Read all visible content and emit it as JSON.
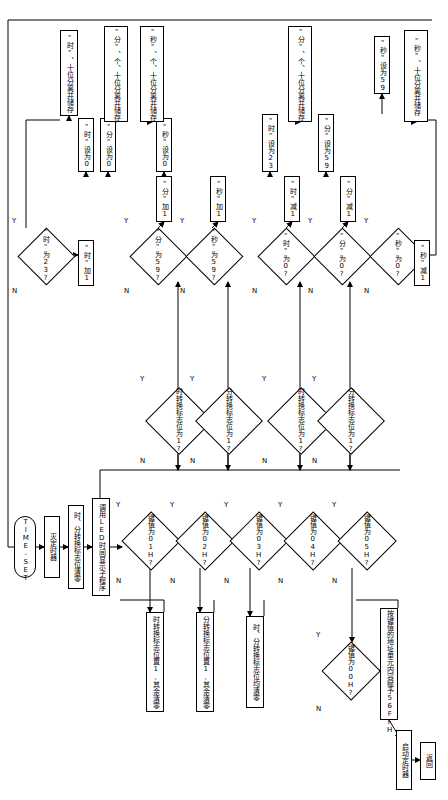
{
  "meta": {
    "branch_yes": "Y",
    "branch_no": "N"
  },
  "nodes": [
    {
      "id": "n_start",
      "type": "terminator",
      "text": "TIME-SET",
      "x": 14,
      "y": 516,
      "w": 22,
      "h": 62
    },
    {
      "id": "n_kill",
      "type": "process",
      "text": "灭定时器",
      "x": 44,
      "y": 516,
      "w": 16,
      "h": 62
    },
    {
      "id": "n_hflag",
      "type": "process",
      "text": "时、分转换标志位清零",
      "x": 68,
      "y": 505,
      "w": 16,
      "h": 84
    },
    {
      "id": "n_led",
      "type": "process",
      "text": "调用LED时间显示子程序",
      "x": 92,
      "y": 498,
      "w": 18,
      "h": 98
    },
    {
      "id": "n_k1",
      "type": "decision",
      "text": "键值为01H?",
      "x": 122,
      "y": 512,
      "w": 56,
      "h": 56
    },
    {
      "id": "n_k2",
      "type": "decision",
      "text": "键值为02H?",
      "x": 176,
      "y": 512,
      "w": 56,
      "h": 56
    },
    {
      "id": "n_k3",
      "type": "decision",
      "text": "键值为03H?",
      "x": 230,
      "y": 512,
      "w": 56,
      "h": 56
    },
    {
      "id": "n_k4",
      "type": "decision",
      "text": "键值为04H?",
      "x": 284,
      "y": 512,
      "w": 56,
      "h": 56
    },
    {
      "id": "n_k5",
      "type": "decision",
      "text": "键值为05H?",
      "x": 338,
      "y": 512,
      "w": 56,
      "h": 56
    },
    {
      "id": "n_k6",
      "type": "decision",
      "text": "键值为00H?",
      "x": 322,
      "y": 642,
      "w": 56,
      "h": 56
    },
    {
      "id": "n_hset",
      "type": "process",
      "text": "时转换标志位置1,其余清零",
      "x": 146,
      "y": 612,
      "w": 18,
      "h": 100
    },
    {
      "id": "n_mset",
      "type": "process",
      "text": "分转换标志位置1,其余清零",
      "x": 196,
      "y": 612,
      "w": 18,
      "h": 100
    },
    {
      "id": "n_clr",
      "type": "process",
      "text": "时、分转换标志位均清零",
      "x": 246,
      "y": 616,
      "w": 18,
      "h": 92
    },
    {
      "id": "n_keyval",
      "type": "process",
      "text": "按键值的地址单元内容赋予56FFH",
      "x": 380,
      "y": 608,
      "w": 18,
      "h": 112
    },
    {
      "id": "n_timer",
      "type": "process",
      "text": "启动定时器",
      "x": 396,
      "y": 730,
      "w": 16,
      "h": 60
    },
    {
      "id": "n_return",
      "type": "process",
      "text": "返回",
      "x": 420,
      "y": 742,
      "w": 16,
      "h": 38
    },
    {
      "id": "n_hconv",
      "type": "decision",
      "text": "时转换标志位为1?",
      "x": 146,
      "y": 388,
      "w": 64,
      "h": 64
    },
    {
      "id": "n_mconv",
      "type": "decision",
      "text": "分转换标志位为1?",
      "x": 196,
      "y": 388,
      "w": 64,
      "h": 64
    },
    {
      "id": "n_hconv2",
      "type": "decision",
      "text": "时转换标志位为1?",
      "x": 268,
      "y": 388,
      "w": 64,
      "h": 64
    },
    {
      "id": "n_mconv2",
      "type": "decision",
      "text": "分转换标志位为1?",
      "x": 318,
      "y": 388,
      "w": 64,
      "h": 64
    },
    {
      "id": "n_h23",
      "type": "decision",
      "text": "\"时\"为23?",
      "x": 18,
      "y": 228,
      "w": 54,
      "h": 54
    },
    {
      "id": "n_m59",
      "type": "decision",
      "text": "\"分\"为59?",
      "x": 130,
      "y": 228,
      "w": 54,
      "h": 54
    },
    {
      "id": "n_s59",
      "type": "decision",
      "text": "\"秒\"为59?",
      "x": 186,
      "y": 228,
      "w": 54,
      "h": 54
    },
    {
      "id": "n_h0",
      "type": "decision",
      "text": "\"时\"为0?",
      "x": 258,
      "y": 228,
      "w": 54,
      "h": 54
    },
    {
      "id": "n_m0",
      "type": "decision",
      "text": "\"分\"为0?",
      "x": 314,
      "y": 228,
      "w": 54,
      "h": 54
    },
    {
      "id": "n_s0",
      "type": "decision",
      "text": "\"秒\"为0?",
      "x": 370,
      "y": 228,
      "w": 54,
      "h": 54
    },
    {
      "id": "n_hp1",
      "type": "process",
      "text": "\"时\"加1",
      "x": 78,
      "y": 240,
      "w": 16,
      "h": 46
    },
    {
      "id": "n_mp1",
      "type": "process",
      "text": "\"分\"加1",
      "x": 156,
      "y": 176,
      "w": 16,
      "h": 46
    },
    {
      "id": "n_sp1",
      "type": "process",
      "text": "\"秒\"加1",
      "x": 210,
      "y": 176,
      "w": 16,
      "h": 46
    },
    {
      "id": "n_hm1",
      "type": "process",
      "text": "\"时\"减1",
      "x": 284,
      "y": 176,
      "w": 16,
      "h": 46
    },
    {
      "id": "n_mm1",
      "type": "process",
      "text": "\"分\"减1",
      "x": 340,
      "y": 176,
      "w": 16,
      "h": 46
    },
    {
      "id": "n_sm1",
      "type": "process",
      "text": "\"秒\"减1",
      "x": 414,
      "y": 240,
      "w": 16,
      "h": 46
    },
    {
      "id": "n_hset0",
      "type": "process",
      "text": "\"时\"设为0",
      "x": 78,
      "y": 118,
      "w": 16,
      "h": 54
    },
    {
      "id": "n_mset0",
      "type": "process",
      "text": "\"分\"设为0",
      "x": 100,
      "y": 118,
      "w": 16,
      "h": 54
    },
    {
      "id": "n_sset0",
      "type": "process",
      "text": "\"秒\"设为0",
      "x": 156,
      "y": 118,
      "w": 16,
      "h": 54
    },
    {
      "id": "n_hset23",
      "type": "process",
      "text": "\"时\"设为23",
      "x": 262,
      "y": 114,
      "w": 16,
      "h": 58
    },
    {
      "id": "n_mset59",
      "type": "process",
      "text": "\"分\"设为59",
      "x": 318,
      "y": 114,
      "w": 16,
      "h": 58
    },
    {
      "id": "n_sset59",
      "type": "process",
      "text": "\"秒\"设为59",
      "x": 374,
      "y": 36,
      "w": 16,
      "h": 58
    },
    {
      "id": "n_sp_h",
      "type": "process",
      "text": "\"时\"、十位分离并储存",
      "x": 60,
      "y": 30,
      "w": 18,
      "h": 86
    },
    {
      "id": "n_sp_h2",
      "type": "process",
      "text": "\"分\"、个、十位分离并储存",
      "x": 104,
      "y": 26,
      "w": 24,
      "h": 96
    },
    {
      "id": "n_sp_s",
      "type": "process",
      "text": "\"秒\"、个、十位分离并储存",
      "x": 140,
      "y": 26,
      "w": 24,
      "h": 96
    },
    {
      "id": "n_sp_m2",
      "type": "process",
      "text": "\"分\"、个、十位分离并储存",
      "x": 288,
      "y": 26,
      "w": 24,
      "h": 96
    },
    {
      "id": "n_sp_s2",
      "type": "process",
      "text": "\"秒\"、十位分离并储存",
      "x": 404,
      "y": 30,
      "w": 24,
      "h": 92
    }
  ],
  "branch_labels": [
    {
      "text": "Y",
      "x": 116,
      "y": 502
    },
    {
      "text": "N",
      "x": 116,
      "y": 578
    },
    {
      "text": "Y",
      "x": 170,
      "y": 502
    },
    {
      "text": "N",
      "x": 170,
      "y": 578
    },
    {
      "text": "Y",
      "x": 224,
      "y": 502
    },
    {
      "text": "N",
      "x": 224,
      "y": 578
    },
    {
      "text": "Y",
      "x": 278,
      "y": 502
    },
    {
      "text": "N",
      "x": 278,
      "y": 578
    },
    {
      "text": "Y",
      "x": 332,
      "y": 502
    },
    {
      "text": "N",
      "x": 332,
      "y": 578
    },
    {
      "text": "Y",
      "x": 316,
      "y": 632
    },
    {
      "text": "N",
      "x": 316,
      "y": 706
    },
    {
      "text": "Y",
      "x": 140,
      "y": 376
    },
    {
      "text": "N",
      "x": 140,
      "y": 458
    },
    {
      "text": "Y",
      "x": 190,
      "y": 376
    },
    {
      "text": "N",
      "x": 190,
      "y": 458
    },
    {
      "text": "Y",
      "x": 262,
      "y": 376
    },
    {
      "text": "N",
      "x": 262,
      "y": 458
    },
    {
      "text": "Y",
      "x": 312,
      "y": 376
    },
    {
      "text": "N",
      "x": 312,
      "y": 458
    },
    {
      "text": "Y",
      "x": 12,
      "y": 218
    },
    {
      "text": "N",
      "x": 12,
      "y": 288
    },
    {
      "text": "Y",
      "x": 124,
      "y": 218
    },
    {
      "text": "N",
      "x": 124,
      "y": 288
    },
    {
      "text": "Y",
      "x": 180,
      "y": 218
    },
    {
      "text": "N",
      "x": 180,
      "y": 288
    },
    {
      "text": "Y",
      "x": 252,
      "y": 218
    },
    {
      "text": "N",
      "x": 252,
      "y": 288
    },
    {
      "text": "Y",
      "x": 308,
      "y": 218
    },
    {
      "text": "N",
      "x": 308,
      "y": 288
    },
    {
      "text": "Y",
      "x": 364,
      "y": 218
    },
    {
      "text": "N",
      "x": 364,
      "y": 288
    }
  ]
}
